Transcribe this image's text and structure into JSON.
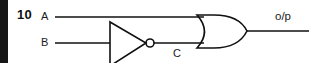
{
  "figure": {
    "question_number": "10",
    "type": "logic-circuit-diagram"
  },
  "labels": {
    "input_a": "A",
    "input_b": "B",
    "intermediate_c": "C",
    "output": "o/p"
  },
  "gates": [
    {
      "name": "not-gate",
      "symbol": "inverter",
      "inputs": [
        "B"
      ],
      "outputs": [
        "C"
      ]
    },
    {
      "name": "or-gate",
      "symbol": "or",
      "inputs": [
        "A",
        "C"
      ],
      "outputs": [
        "o/p"
      ]
    }
  ],
  "colors": {
    "ink": "#101010",
    "background": "#ffffff",
    "page_edge": "#161616"
  }
}
